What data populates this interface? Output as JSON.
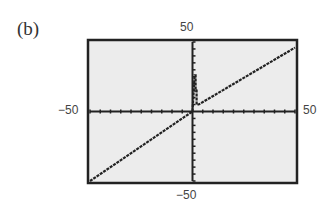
{
  "panel_label": "(b)",
  "chart_data": {
    "type": "line",
    "title": "",
    "xlabel": "",
    "ylabel": "",
    "xlim": [
      -50,
      50
    ],
    "ylim": [
      -50,
      50
    ],
    "xticks_step": 5,
    "yticks_step": 5,
    "grid": false,
    "tick_labels": {
      "top": "50",
      "bottom": "−50",
      "left": "−50",
      "right": "50"
    },
    "series": [
      {
        "name": "graph",
        "description": "Calculator graph: approximately y = x line across the window with a narrow spike near x just above 0",
        "points": [
          [
            -50,
            -50
          ],
          [
            0,
            0
          ],
          [
            1,
            26
          ],
          [
            1.5,
            26
          ],
          [
            1.5,
            15
          ],
          [
            2,
            15
          ],
          [
            2,
            5
          ],
          [
            3,
            5
          ],
          [
            50,
            46
          ]
        ]
      }
    ],
    "colors": {
      "background": "#ececec",
      "frame": "#222222",
      "line": "#222222"
    }
  }
}
